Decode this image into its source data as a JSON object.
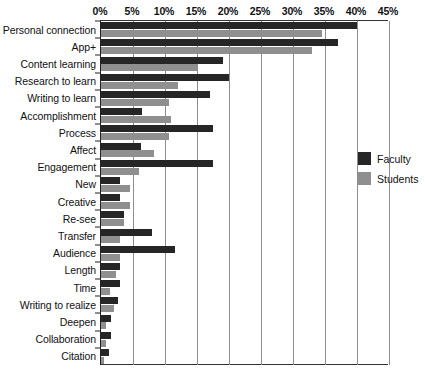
{
  "chart_data": {
    "type": "bar",
    "orientation": "horizontal",
    "title": "",
    "subtitle": "",
    "xlabel": "",
    "ylabel": "",
    "xlim": [
      0,
      45
    ],
    "grid": true,
    "legend_position": "right",
    "x_tick_labels": [
      "0%",
      "5%",
      "10%",
      "15%",
      "20%",
      "25%",
      "30%",
      "35%",
      "40%",
      "45%"
    ],
    "x_tick_values": [
      0,
      5,
      10,
      15,
      20,
      25,
      30,
      35,
      40,
      45
    ],
    "categories": [
      "Personal connection",
      "App+",
      "Content learning",
      "Research to learn",
      "Writing to learn",
      "Accomplishment",
      "Process",
      "Affect",
      "Engagement",
      "New",
      "Creative",
      "Re-see",
      "Transfer",
      "Audience",
      "Length",
      "Time",
      "Writing to realize",
      "Deepen",
      "Collaboration",
      "Citation"
    ],
    "series": [
      {
        "name": "Faculty",
        "color": "#262626",
        "values": [
          40.0,
          37.0,
          19.0,
          20.0,
          17.0,
          6.4,
          17.5,
          6.2,
          17.5,
          3.0,
          3.0,
          3.6,
          8.0,
          11.5,
          3.0,
          3.0,
          2.6,
          1.6,
          1.6,
          1.2
        ]
      },
      {
        "name": "Students",
        "color": "#8f8f8f",
        "values": [
          34.5,
          33.0,
          15.0,
          12.0,
          10.7,
          11.0,
          10.7,
          8.3,
          6.0,
          4.5,
          4.5,
          3.6,
          3.0,
          3.0,
          2.4,
          1.4,
          2.0,
          0.8,
          0.8,
          0.5
        ]
      }
    ],
    "legend": [
      {
        "label": "Faculty",
        "color": "#262626"
      },
      {
        "label": "Students",
        "color": "#8f8f8f"
      }
    ]
  }
}
